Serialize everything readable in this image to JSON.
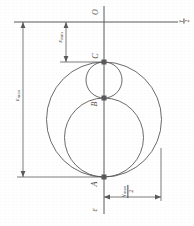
{
  "figure": {
    "stroke_color": "#5a5a5a",
    "background": "#ffffff"
  },
  "axis": {
    "vertical_axis_label": "ε",
    "horizontal_axis_label_num": "γ",
    "horizontal_axis_label_den": "2",
    "origin_label": "O"
  },
  "points": [
    {
      "id": "O",
      "label": "O",
      "x": 104,
      "y": 12,
      "marker": false
    },
    {
      "id": "C",
      "label": "C",
      "x": 104,
      "y": 62,
      "marker": true
    },
    {
      "id": "B",
      "label": "B",
      "x": 104,
      "y": 98,
      "marker": true
    },
    {
      "id": "A",
      "label": "A",
      "x": 104,
      "y": 177,
      "marker": true
    }
  ],
  "circles": [
    {
      "id": "circle-outer",
      "name": "circle-A-C",
      "cx": 104,
      "cy": 119.5,
      "r": 57.5
    },
    {
      "id": "circle-medium",
      "name": "circle-A-B",
      "cx": 104,
      "cy": 137.5,
      "r": 39.5
    },
    {
      "id": "circle-small",
      "name": "circle-B-C",
      "cx": 104,
      "cy": 80.0,
      "r": 18.0
    }
  ],
  "dimensions": [
    {
      "id": "eps-max",
      "name": "epsilon-max-dimension",
      "label": "ε",
      "subscript": "max",
      "orientation": "vertical",
      "from_y": 22,
      "to_y": 177,
      "line_x": 23
    },
    {
      "id": "eps-min",
      "name": "epsilon-min-dimension",
      "label": "ε",
      "subscript": "min",
      "orientation": "vertical",
      "from_y": 22,
      "to_y": 62,
      "line_x": 66
    },
    {
      "id": "gamma-max-half",
      "name": "gamma-max-half-dimension",
      "numerator": "γ",
      "subscript": "max",
      "denominator": "2",
      "orientation": "horizontal",
      "from_x": 104,
      "to_x": 161,
      "line_y": 197
    }
  ],
  "leader_lines": {
    "top_reference_y": 22,
    "c_reference_y": 62,
    "a_reference_y": 177,
    "right_vertical_x": 161,
    "right_vertical_from_y": 148,
    "right_vertical_to_y": 197
  }
}
